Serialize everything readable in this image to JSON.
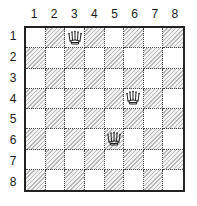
{
  "board": {
    "size": 8,
    "column_labels": [
      "1",
      "2",
      "3",
      "4",
      "5",
      "6",
      "7",
      "8"
    ],
    "row_labels": [
      "1",
      "2",
      "3",
      "4",
      "5",
      "6",
      "7",
      "8"
    ],
    "hatch_rule": "hatched when (row + column) is odd",
    "colors": {
      "light_square": "#ffffff",
      "hatched_square_line": "#b8b8b8",
      "border": "#222222"
    }
  },
  "pieces": [
    {
      "type": "queen",
      "icon": "queen-icon",
      "row": 1,
      "column": 3
    },
    {
      "type": "queen",
      "icon": "queen-icon",
      "row": 4,
      "column": 6
    },
    {
      "type": "queen",
      "icon": "queen-icon",
      "row": 6,
      "column": 5
    }
  ]
}
